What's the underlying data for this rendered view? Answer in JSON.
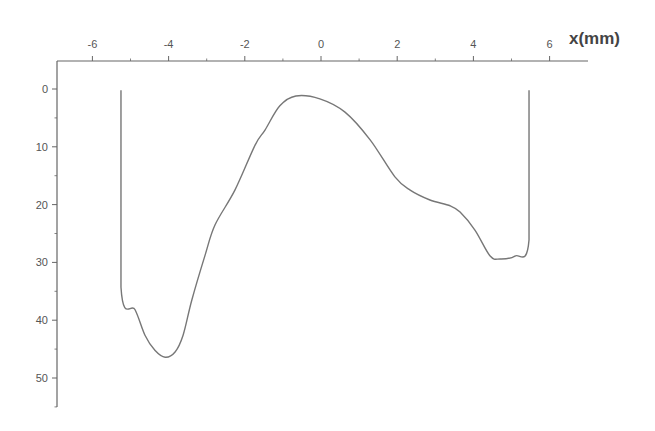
{
  "chart_data": {
    "type": "line",
    "title": "",
    "xlabel": "x(mm)",
    "ylabel": "",
    "x_axis_position": "top",
    "y_axis_inverted": true,
    "xlim": [
      -6.5,
      7
    ],
    "ylim": [
      -4.5,
      55
    ],
    "x_ticks": [
      -6,
      -4,
      -2,
      0,
      2,
      4,
      6
    ],
    "x_tick_labels": [
      "-6",
      "-4",
      "-2",
      "0",
      "2",
      "4",
      "6"
    ],
    "y_ticks": [
      0,
      10,
      20,
      30,
      40,
      50
    ],
    "y_tick_labels": [
      "0",
      "10",
      "20",
      "30",
      "40",
      "50"
    ],
    "grid": false,
    "legend": null,
    "series": [
      {
        "name": "profile",
        "color": "#777777",
        "x": [
          -5.25,
          -5.25,
          -4.88,
          -4.62,
          -4.36,
          -4.09,
          -3.83,
          -3.62,
          -3.39,
          -3.04,
          -2.78,
          -2.26,
          -1.73,
          -1.47,
          -1.08,
          -0.66,
          -0.03,
          0.63,
          1.29,
          1.94,
          2.34,
          2.86,
          3.39,
          3.65,
          4.04,
          4.44,
          4.7,
          5.09,
          5.46,
          5.46
        ],
        "y": [
          0.2,
          34.3,
          38.2,
          42.6,
          45.2,
          46.4,
          45.5,
          42.6,
          36.5,
          28.7,
          23.5,
          17.5,
          9.7,
          7.1,
          2.9,
          1.2,
          1.7,
          4.0,
          8.8,
          15.2,
          17.5,
          19.2,
          20.2,
          21.3,
          24.4,
          28.9,
          29.4,
          28.9,
          26.1,
          0.2
        ]
      }
    ]
  },
  "layout": {
    "plot_left_px": 57,
    "axis_top_px": 61,
    "axis_right_px": 588,
    "axis_bottom_px": 407,
    "x0_px": 321,
    "x_px_per_unit": 38.1,
    "y0_px": 89,
    "y_px_per_unit": 5.78
  }
}
